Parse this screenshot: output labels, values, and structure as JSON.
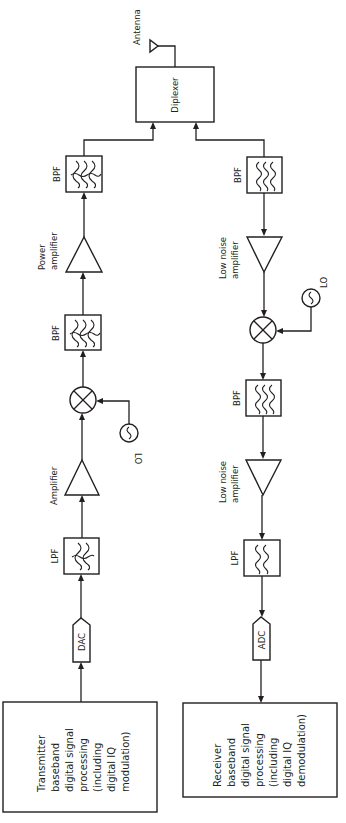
{
  "diagram": {
    "colors": {
      "stroke": "#231f20",
      "background": "#ffffff"
    },
    "antenna": {
      "label": "Antenna"
    },
    "diplexer": {
      "label": "Diplexer"
    },
    "transmit_chain": {
      "blocks": [
        {
          "id": "tx-dsp",
          "type": "box",
          "label_lines": [
            "Transmitter",
            "baseband",
            "digital signal",
            "processing",
            "(including",
            "digital IQ",
            "modulation)"
          ]
        },
        {
          "id": "dac",
          "type": "converter",
          "label": "DAC"
        },
        {
          "id": "tx-lpf",
          "type": "filter",
          "label": "LPF"
        },
        {
          "id": "tx-amp",
          "type": "amplifier",
          "label": "Amplifier"
        },
        {
          "id": "tx-mixer",
          "type": "mixer",
          "label": ""
        },
        {
          "id": "tx-lo",
          "type": "oscillator",
          "label": "LO"
        },
        {
          "id": "tx-bpf1",
          "type": "filter",
          "label": "BPF"
        },
        {
          "id": "tx-pa",
          "type": "amplifier",
          "label_lines": [
            "Power",
            "amplifier"
          ]
        },
        {
          "id": "tx-bpf2",
          "type": "filter",
          "label": "BPF"
        }
      ]
    },
    "receive_chain": {
      "blocks": [
        {
          "id": "rx-bpf1",
          "type": "filter",
          "label": "BPF"
        },
        {
          "id": "rx-lna1",
          "type": "amplifier",
          "label_lines": [
            "Low noise",
            "amplifier"
          ]
        },
        {
          "id": "rx-mixer",
          "type": "mixer",
          "label": ""
        },
        {
          "id": "rx-lo",
          "type": "oscillator",
          "label": "LO"
        },
        {
          "id": "rx-bpf2",
          "type": "filter",
          "label": "BPF"
        },
        {
          "id": "rx-lna2",
          "type": "amplifier",
          "label_lines": [
            "Low noise",
            "amplifier"
          ]
        },
        {
          "id": "rx-lpf",
          "type": "filter",
          "label": "LPF"
        },
        {
          "id": "adc",
          "type": "converter",
          "label": "ADC"
        },
        {
          "id": "rx-dsp",
          "type": "box",
          "label_lines": [
            "Receiver",
            "baseband",
            "digital signal",
            "processing",
            "(including",
            "digital IQ",
            "demodulation)"
          ]
        }
      ]
    }
  }
}
